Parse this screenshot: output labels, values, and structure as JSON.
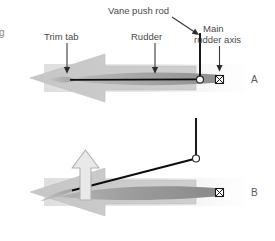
{
  "figure": {
    "title_cutoff_fragment": "g",
    "labels": {
      "vane_push_rod": "Vane push rod",
      "trim_tab": "Trim tab",
      "rudder": "Rudder",
      "main_rudder_axis_line1": "Main",
      "main_rudder_axis_line2": "rudder axis"
    },
    "panels": [
      {
        "id": "A",
        "letter": "A",
        "state": "neutral",
        "flow_arrow": "large-left-arrow",
        "lift_arrow": false
      },
      {
        "id": "B",
        "letter": "B",
        "state": "deflected",
        "flow_arrow": "large-left-arrow",
        "lift_arrow": true
      }
    ],
    "markers": {
      "pivot": "white-circle-pivot",
      "axis": "crossed-square-axis-marker",
      "leader_arrowheads": 4
    },
    "colors": {
      "flow_arrow_fill": "#c9c9c9",
      "flow_arrow_edge": "#b4b4b4",
      "foil_dark": "#8a8a8a",
      "foil_mid": "#a6a6a6",
      "foil_light": "#c2c2c2",
      "rod_stroke": "#000000",
      "label_text": "#4a4a4a",
      "lift_arrow_fill": "#e8e8e8",
      "lift_arrow_stroke": "#b0b0b0",
      "wake_tint": "#d8d8d8"
    }
  }
}
